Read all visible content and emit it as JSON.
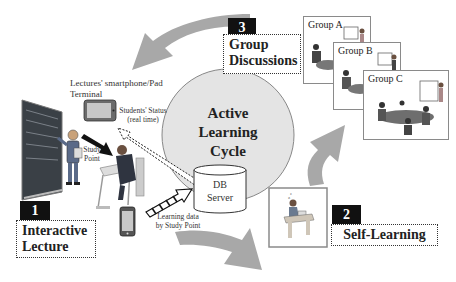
{
  "diagram": {
    "center": {
      "title_lines": [
        "Active",
        "Learning",
        "Cycle"
      ],
      "db_server_lines": [
        "DB",
        "Server"
      ]
    },
    "stages": [
      {
        "number": "1",
        "title_lines": [
          "Interactive",
          "Lecture"
        ]
      },
      {
        "number": "2",
        "title_lines": [
          "Self-Learning"
        ]
      },
      {
        "number": "3",
        "title_lines": [
          "Group",
          "Discussions"
        ]
      }
    ],
    "groups": [
      "Group A",
      "Group B",
      "Group C"
    ],
    "annotations": {
      "terminal_lines": [
        "Lectures' smartphone/Pad",
        "Terminal"
      ],
      "students_status_lines": [
        "Students' Status",
        "(real time)"
      ],
      "study_point_lines": [
        "Study",
        "Point"
      ],
      "learning_data_lines": [
        "Learning data",
        "by Study Point"
      ]
    },
    "colors": {
      "cycle_arrow": "#a8a8a8",
      "circle_fill": "#e4e4e4",
      "circle_stroke": "#888888",
      "badge": "#111111",
      "chalkboard": "#3a4046"
    }
  }
}
